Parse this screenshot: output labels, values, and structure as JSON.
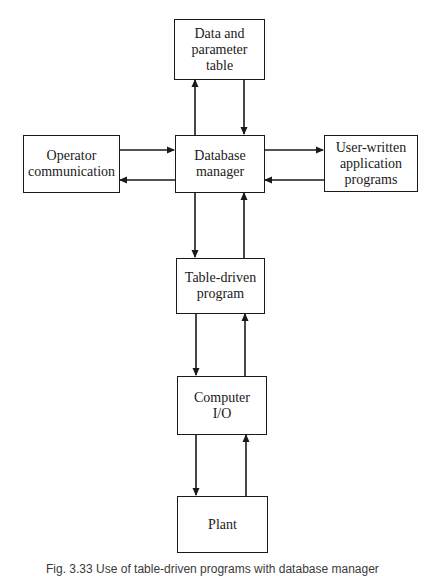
{
  "diagram": {
    "nodes": [
      {
        "id": "data_table",
        "label": "Data and\nparameter\ntable"
      },
      {
        "id": "operator",
        "label": "Operator\ncommunication"
      },
      {
        "id": "db_manager",
        "label": "Database\nmanager"
      },
      {
        "id": "user_programs",
        "label": "User-written\napplication\nprograms"
      },
      {
        "id": "table_driven",
        "label": "Table-driven\nprogram"
      },
      {
        "id": "computer_io",
        "label": "Computer\nI/O"
      },
      {
        "id": "plant",
        "label": "Plant"
      }
    ],
    "edges": [
      {
        "from": "db_manager",
        "to": "data_table"
      },
      {
        "from": "data_table",
        "to": "db_manager"
      },
      {
        "from": "operator",
        "to": "db_manager"
      },
      {
        "from": "db_manager",
        "to": "operator"
      },
      {
        "from": "db_manager",
        "to": "user_programs"
      },
      {
        "from": "user_programs",
        "to": "db_manager"
      },
      {
        "from": "db_manager",
        "to": "table_driven"
      },
      {
        "from": "table_driven",
        "to": "db_manager"
      },
      {
        "from": "table_driven",
        "to": "computer_io"
      },
      {
        "from": "computer_io",
        "to": "table_driven"
      },
      {
        "from": "computer_io",
        "to": "plant"
      },
      {
        "from": "plant",
        "to": "computer_io"
      }
    ],
    "caption": "Fig. 3.33  Use of table-driven programs with database manager"
  }
}
